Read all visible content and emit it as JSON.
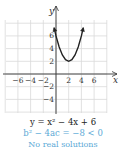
{
  "chart_data": {
    "type": "line",
    "title": "",
    "xlabel": "x",
    "ylabel": "y",
    "xlim": [
      -8,
      8
    ],
    "ylim": [
      -6,
      8.5
    ],
    "grid": true,
    "x_ticks": [
      -6,
      -4,
      -2,
      2,
      4,
      6
    ],
    "y_ticks": [
      -4,
      -2,
      2,
      4,
      6
    ],
    "series": [
      {
        "name": "y = x^2 - 4x + 6",
        "function": "x^2 - 4x + 6",
        "x": [
          -0.3,
          0,
          0.5,
          1,
          1.5,
          2,
          2.5,
          3,
          3.5,
          4,
          4.3
        ],
        "values": [
          7.29,
          6,
          4.25,
          3,
          2.25,
          2,
          2.25,
          3,
          4.25,
          6,
          7.29
        ],
        "vertex": [
          2,
          2
        ],
        "color": "#222222"
      }
    ]
  },
  "labels": {
    "y_axis": "y",
    "x_axis": "x",
    "x_ticks": [
      "−6",
      "−4",
      "−2",
      "2",
      "4",
      "6"
    ],
    "y_ticks": [
      "6",
      "4",
      "2",
      "−2",
      "−4"
    ]
  },
  "captions": {
    "equation": "y = x² − 4x + 6",
    "discriminant": "b² − 4ac = −8 < 0",
    "cut_line": "No real solutions"
  },
  "colors": {
    "curve": "#222222",
    "axis": "#333333",
    "grid": "#d9d9d9",
    "accent": "#5aa9d6"
  }
}
